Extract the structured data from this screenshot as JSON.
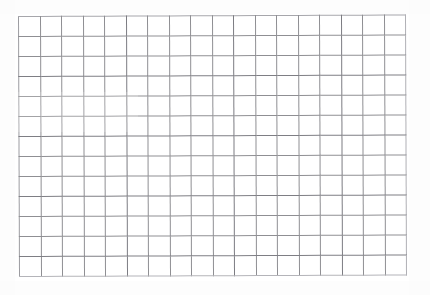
{
  "document": {
    "kind": "blank-grid-sheet",
    "title": "",
    "description": "Scanned blank grid / graph-paper table",
    "background_color": "#ffffff",
    "line_color": "#8f8f93"
  },
  "grid": {
    "columns": 18,
    "rows": 13,
    "cell_width_px": 21.6,
    "cell_height_px": 20.1,
    "left_px": 18,
    "top_px": 16,
    "width_px": 388,
    "height_px": 261,
    "column_headers": [
      "",
      "",
      "",
      "",
      "",
      "",
      "",
      "",
      "",
      "",
      "",
      "",
      "",
      "",
      "",
      "",
      "",
      ""
    ],
    "cells": [
      [
        "",
        "",
        "",
        "",
        "",
        "",
        "",
        "",
        "",
        "",
        "",
        "",
        "",
        "",
        "",
        "",
        "",
        ""
      ],
      [
        "",
        "",
        "",
        "",
        "",
        "",
        "",
        "",
        "",
        "",
        "",
        "",
        "",
        "",
        "",
        "",
        "",
        ""
      ],
      [
        "",
        "",
        "",
        "",
        "",
        "",
        "",
        "",
        "",
        "",
        "",
        "",
        "",
        "",
        "",
        "",
        "",
        ""
      ],
      [
        "",
        "",
        "",
        "",
        "",
        "",
        "",
        "",
        "",
        "",
        "",
        "",
        "",
        "",
        "",
        "",
        "",
        ""
      ],
      [
        "",
        "",
        "",
        "",
        "",
        "",
        "",
        "",
        "",
        "",
        "",
        "",
        "",
        "",
        "",
        "",
        "",
        ""
      ],
      [
        "",
        "",
        "",
        "",
        "",
        "",
        "",
        "",
        "",
        "",
        "",
        "",
        "",
        "",
        "",
        "",
        "",
        ""
      ],
      [
        "",
        "",
        "",
        "",
        "",
        "",
        "",
        "",
        "",
        "",
        "",
        "",
        "",
        "",
        "",
        "",
        "",
        ""
      ],
      [
        "",
        "",
        "",
        "",
        "",
        "",
        "",
        "",
        "",
        "",
        "",
        "",
        "",
        "",
        "",
        "",
        "",
        ""
      ],
      [
        "",
        "",
        "",
        "",
        "",
        "",
        "",
        "",
        "",
        "",
        "",
        "",
        "",
        "",
        "",
        "",
        "",
        ""
      ],
      [
        "",
        "",
        "",
        "",
        "",
        "",
        "",
        "",
        "",
        "",
        "",
        "",
        "",
        "",
        "",
        "",
        "",
        ""
      ],
      [
        "",
        "",
        "",
        "",
        "",
        "",
        "",
        "",
        "",
        "",
        "",
        "",
        "",
        "",
        "",
        "",
        "",
        ""
      ],
      [
        "",
        "",
        "",
        "",
        "",
        "",
        "",
        "",
        "",
        "",
        "",
        "",
        "",
        "",
        "",
        "",
        "",
        ""
      ],
      [
        "",
        "",
        "",
        "",
        "",
        "",
        "",
        "",
        "",
        "",
        "",
        "",
        "",
        "",
        "",
        "",
        "",
        ""
      ]
    ]
  }
}
